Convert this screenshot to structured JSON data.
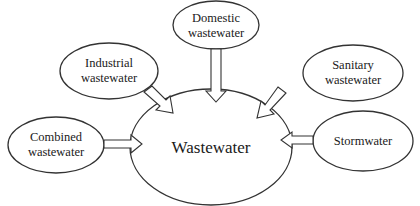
{
  "diagram": {
    "type": "hub-and-spoke",
    "center": {
      "id": "wastewater",
      "label": "Wastewater"
    },
    "sources": [
      {
        "id": "domestic",
        "line1": "Domestic",
        "line2": "wastewater"
      },
      {
        "id": "industrial",
        "line1": "Industrial",
        "line2": "wastewater"
      },
      {
        "id": "sanitary",
        "line1": "Sanitary",
        "line2": "wastewater"
      },
      {
        "id": "combined",
        "line1": "Combined",
        "line2": "wastewater"
      },
      {
        "id": "stormwater",
        "line1": "Stormwater",
        "line2": ""
      }
    ],
    "edges": [
      {
        "from": "domestic",
        "to": "wastewater",
        "style": "hollow-block-arrow"
      },
      {
        "from": "industrial",
        "to": "wastewater",
        "style": "hollow-block-arrow"
      },
      {
        "from": "sanitary",
        "to": "wastewater",
        "style": "hollow-block-arrow"
      },
      {
        "from": "combined",
        "to": "wastewater",
        "style": "hollow-block-arrow"
      },
      {
        "from": "stormwater",
        "to": "wastewater",
        "style": "hollow-block-arrow"
      }
    ],
    "colors": {
      "stroke": "#333333",
      "fill": "#ffffff",
      "text": "#1a1a1a"
    }
  }
}
